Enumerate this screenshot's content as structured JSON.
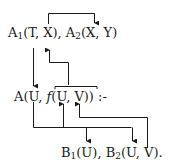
{
  "diagram": {
    "line1": {
      "a1_base": "A",
      "a1_sub": "1",
      "a1_args": "(T, X),",
      "a2_base": "A",
      "a2_sub": "2",
      "a2_args": "(X, Y)"
    },
    "line2": {
      "head_prefix": "A(U, ",
      "func": "f",
      "func_args": "(U, V))",
      "neck": ":-"
    },
    "line3": {
      "b1_base": "B",
      "b1_sub": "1",
      "b1_args": "(U),",
      "b2_base": "B",
      "b2_sub": "2",
      "b2_args": "(U, V)."
    },
    "stroke_color": "#1a1a1a"
  }
}
